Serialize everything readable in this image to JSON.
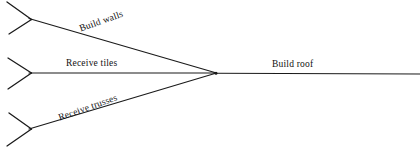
{
  "diagram": {
    "type": "activity-on-arrow-network",
    "background_color": "#ffffff",
    "line_color": "#1a1a1a",
    "text_color": "#111111",
    "merge_node": {
      "x": 216,
      "y": 73
    },
    "edges": [
      {
        "id": "build-walls",
        "label": "Build walls",
        "orientation": "diagonal-descending",
        "rotation_deg": -19.5,
        "from": {
          "x": 31,
          "y": 19
        },
        "to": {
          "x": 216,
          "y": 73
        }
      },
      {
        "id": "receive-tiles",
        "label": "Receive tiles",
        "orientation": "horizontal",
        "rotation_deg": 0,
        "from": {
          "x": 31,
          "y": 73
        },
        "to": {
          "x": 216,
          "y": 73
        }
      },
      {
        "id": "receive-trusses",
        "label": "Receive trusses",
        "orientation": "diagonal-ascending",
        "rotation_deg": -19.5,
        "from": {
          "x": 31,
          "y": 129
        },
        "to": {
          "x": 216,
          "y": 73
        }
      },
      {
        "id": "build-roof",
        "label": "Build roof",
        "orientation": "horizontal",
        "rotation_deg": 0,
        "from": {
          "x": 216,
          "y": 73
        },
        "to": {
          "x": 420,
          "y": 74
        }
      }
    ],
    "forks": [
      {
        "id": "fork-build-walls",
        "tip": {
          "x": 31,
          "y": 19
        },
        "upper_end": {
          "x": 7,
          "y": 2
        },
        "lower_end": {
          "x": 9,
          "y": 34
        }
      },
      {
        "id": "fork-receive-tiles",
        "tip": {
          "x": 31,
          "y": 73
        },
        "upper_end": {
          "x": 8,
          "y": 58
        },
        "lower_end": {
          "x": 8,
          "y": 89
        }
      },
      {
        "id": "fork-receive-trusses",
        "tip": {
          "x": 31,
          "y": 129
        },
        "upper_end": {
          "x": 9,
          "y": 113
        },
        "lower_end": {
          "x": 7,
          "y": 146
        }
      }
    ]
  }
}
